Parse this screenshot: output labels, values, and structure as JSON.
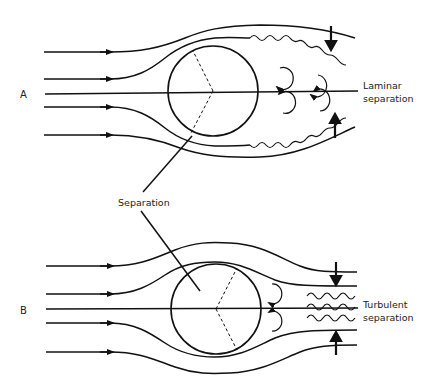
{
  "diagram": {
    "panels": [
      {
        "id": "A",
        "label": "A",
        "description_lines": [
          "Laminar",
          "separation"
        ],
        "wake": "laminar"
      },
      {
        "id": "B",
        "label": "B",
        "description_lines": [
          "Turbulent",
          "separation"
        ],
        "wake": "turbulent"
      }
    ],
    "shared_label": "Separation",
    "colors": {
      "stroke": "#111111",
      "background": "#ffffff"
    }
  }
}
